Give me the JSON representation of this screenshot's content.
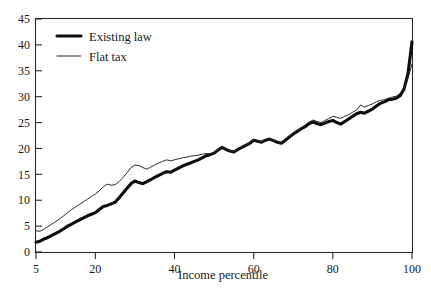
{
  "chart_data": {
    "type": "line",
    "title": "",
    "xlabel": "Income percentile",
    "ylabel": "",
    "xlim": [
      5,
      100
    ],
    "ylim": [
      0,
      45
    ],
    "grid": false,
    "legend_position": "top-left",
    "xticks": [
      5,
      20,
      40,
      60,
      80,
      100
    ],
    "xtick_labels": [
      "5",
      "20",
      "40",
      "60",
      "80",
      "100"
    ],
    "yticks": [
      0,
      5,
      10,
      15,
      20,
      25,
      30,
      35,
      40,
      45
    ],
    "ytick_labels": [
      "0",
      "5",
      "10",
      "15",
      "20",
      "25",
      "30",
      "35",
      "40",
      "45"
    ],
    "x": [
      5,
      6,
      7,
      8,
      9,
      10,
      11,
      12,
      13,
      14,
      15,
      16,
      17,
      18,
      19,
      20,
      21,
      22,
      23,
      24,
      25,
      26,
      27,
      28,
      29,
      30,
      31,
      32,
      33,
      34,
      35,
      36,
      37,
      38,
      39,
      40,
      41,
      42,
      43,
      44,
      45,
      46,
      47,
      48,
      49,
      50,
      51,
      52,
      53,
      54,
      55,
      56,
      57,
      58,
      59,
      60,
      61,
      62,
      63,
      64,
      65,
      66,
      67,
      68,
      69,
      70,
      71,
      72,
      73,
      74,
      75,
      76,
      77,
      78,
      79,
      80,
      81,
      82,
      83,
      84,
      85,
      86,
      87,
      88,
      89,
      90,
      91,
      92,
      93,
      94,
      95,
      96,
      97,
      98,
      99,
      100
    ],
    "series": [
      {
        "name": "Existing law",
        "style": "thick",
        "values": [
          1.9,
          2.1,
          2.5,
          2.8,
          3.2,
          3.6,
          4.0,
          4.5,
          5.0,
          5.4,
          5.8,
          6.2,
          6.6,
          7.0,
          7.3,
          7.6,
          8.2,
          8.8,
          9.0,
          9.3,
          9.6,
          10.5,
          11.4,
          12.3,
          13.2,
          13.7,
          13.4,
          13.2,
          13.6,
          14.0,
          14.4,
          14.8,
          15.2,
          15.5,
          15.4,
          15.8,
          16.2,
          16.6,
          16.9,
          17.2,
          17.5,
          17.8,
          18.2,
          18.6,
          18.8,
          19.1,
          19.7,
          20.2,
          19.8,
          19.5,
          19.3,
          19.8,
          20.2,
          20.6,
          21.0,
          21.6,
          21.4,
          21.2,
          21.6,
          21.8,
          21.5,
          21.2,
          21.0,
          21.6,
          22.2,
          22.8,
          23.3,
          23.8,
          24.2,
          24.8,
          25.1,
          24.8,
          24.6,
          24.9,
          25.2,
          25.4,
          25.0,
          24.7,
          25.2,
          25.7,
          26.2,
          26.7,
          27.0,
          26.8,
          27.2,
          27.6,
          28.2,
          28.7,
          29.0,
          29.4,
          29.5,
          29.7,
          30.2,
          31.5,
          34.5,
          40.6
        ]
      },
      {
        "name": "Flat tax",
        "style": "thin",
        "values": [
          4.1,
          4.0,
          4.4,
          4.9,
          5.4,
          5.9,
          6.4,
          7.0,
          7.6,
          8.2,
          8.7,
          9.2,
          9.7,
          10.2,
          10.7,
          11.2,
          11.8,
          12.6,
          13.1,
          12.9,
          13.0,
          13.6,
          14.4,
          15.3,
          16.3,
          16.8,
          16.7,
          16.3,
          16.0,
          16.4,
          16.8,
          17.2,
          17.5,
          17.8,
          17.6,
          17.8,
          18.0,
          18.2,
          18.3,
          18.5,
          18.6,
          18.7,
          18.9,
          19.0,
          19.0,
          19.2,
          19.8,
          20.3,
          19.9,
          19.6,
          19.4,
          19.9,
          20.3,
          20.7,
          21.1,
          21.7,
          21.5,
          21.3,
          21.7,
          21.9,
          21.6,
          21.3,
          21.1,
          21.8,
          22.4,
          23.0,
          23.5,
          24.0,
          24.5,
          25.1,
          25.5,
          25.2,
          25.0,
          25.4,
          25.8,
          26.2,
          26.0,
          25.8,
          26.2,
          26.5,
          27.0,
          27.4,
          28.4,
          28.0,
          28.3,
          28.6,
          29.0,
          29.3,
          29.4,
          29.7,
          29.9,
          30.1,
          30.6,
          31.4,
          33.6,
          36.3
        ]
      }
    ]
  },
  "legend": {
    "items": [
      {
        "label": "Existing law",
        "style": "thick"
      },
      {
        "label": "Flat tax",
        "style": "thin"
      }
    ]
  }
}
